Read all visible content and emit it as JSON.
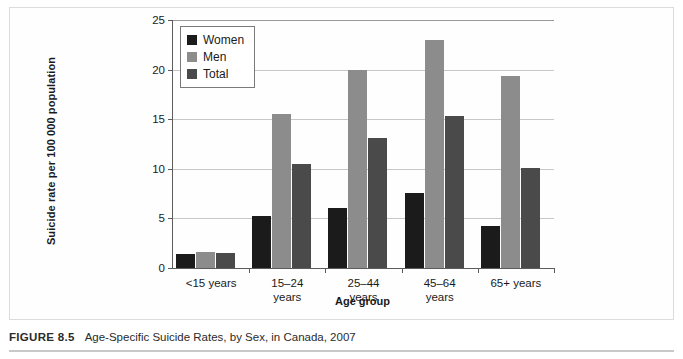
{
  "figure": {
    "caption_label": "FIGURE 8.5",
    "caption_text": "Age-Specific Suicide Rates, by Sex, in Canada, 2007"
  },
  "legend": {
    "position": "top-left-inside",
    "items": [
      {
        "label": "Women",
        "color": "#1b1b1b"
      },
      {
        "label": "Men",
        "color": "#8c8c8c"
      },
      {
        "label": "Total",
        "color": "#4a4a4a"
      }
    ]
  },
  "axis": {
    "y_ticks": [
      "0",
      "5",
      "10",
      "15",
      "20",
      "25"
    ],
    "x_labels": [
      "<15 years",
      "15–24\nyears",
      "25–44\nyears",
      "45–64\nyears",
      "65+ years"
    ]
  },
  "chart_data": {
    "type": "bar",
    "title": "Age-Specific Suicide Rates, by Sex, in Canada, 2007",
    "xlabel": "Age group",
    "ylabel": "Suicide rate per 100 000 population",
    "categories": [
      "<15 years",
      "15–24 years",
      "25–44 years",
      "45–64 years",
      "65+ years"
    ],
    "series": [
      {
        "name": "Women",
        "color": "#1b1b1b",
        "values": [
          1.4,
          5.2,
          6.1,
          7.6,
          4.2
        ]
      },
      {
        "name": "Men",
        "color": "#8c8c8c",
        "values": [
          1.6,
          15.5,
          20.0,
          23.0,
          19.4
        ]
      },
      {
        "name": "Total",
        "color": "#4a4a4a",
        "values": [
          1.5,
          10.5,
          13.1,
          15.3,
          10.1
        ]
      }
    ],
    "ylim": [
      0,
      25
    ],
    "ytick_step": 5,
    "grid": true,
    "legend_position": "upper left"
  }
}
